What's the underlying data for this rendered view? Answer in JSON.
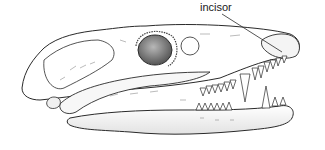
{
  "figure": {
    "view": "lateral",
    "labels": [
      {
        "text": "incisor",
        "x": 200,
        "y": 1,
        "pointer_to": [
          282,
          50
        ]
      }
    ]
  },
  "colors": {
    "background": "#ffffff",
    "line": "#2a2a2a",
    "orbit_fill": "#7a7a7a",
    "bone_shade": "#d8d8d8"
  }
}
